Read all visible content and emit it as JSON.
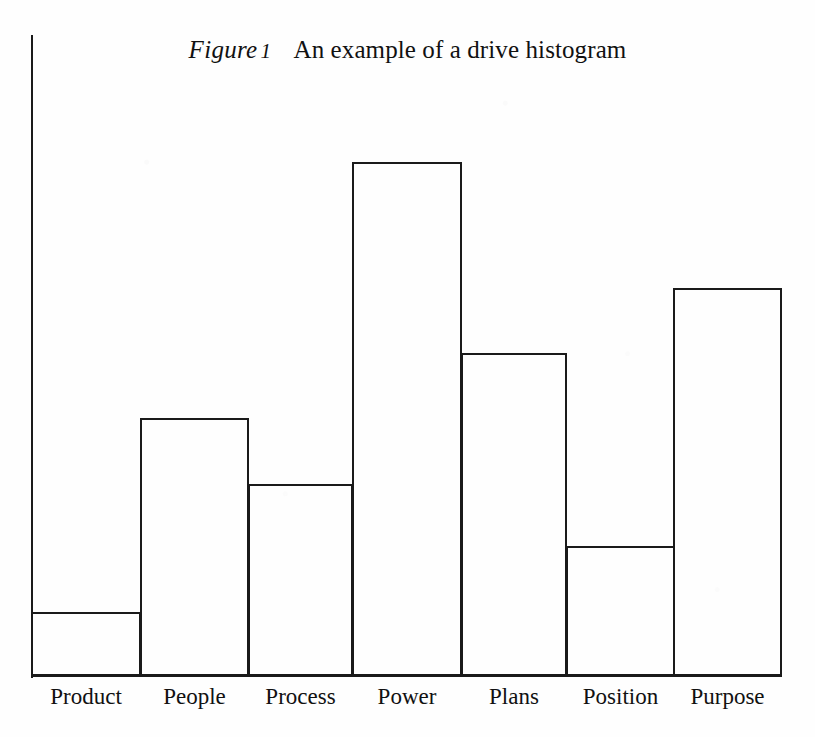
{
  "figure": {
    "label": "Figure",
    "number": "1",
    "caption": "An example of a drive histogram"
  },
  "colors": {
    "ink": "#1a1a1a",
    "page": "#fefefe",
    "bar_fill": "transparent"
  },
  "axes": {
    "y_axis_visible": true,
    "x_axis_visible": true,
    "y_tick_labels": [],
    "grid": false
  },
  "chart_data": {
    "type": "bar",
    "xlabel": "",
    "ylabel": "",
    "categories": [
      "Product",
      "People",
      "Process",
      "Power",
      "Plans",
      "Position",
      "Purpose"
    ],
    "values": [
      64,
      258,
      192,
      514,
      323,
      130,
      388
    ],
    "ylim": [
      0,
      641
    ],
    "grid": false,
    "legend": null,
    "bars": [
      {
        "label": "Product",
        "value": 64,
        "left": 31,
        "right": 141,
        "top": 612
      },
      {
        "label": "People",
        "value": 258,
        "left": 140,
        "right": 249,
        "top": 418
      },
      {
        "label": "Process",
        "value": 192,
        "left": 248,
        "right": 353,
        "top": 484
      },
      {
        "label": "Power",
        "value": 514,
        "left": 352,
        "right": 462,
        "top": 162
      },
      {
        "label": "Plans",
        "value": 323,
        "left": 461,
        "right": 567,
        "top": 353
      },
      {
        "label": "Position",
        "value": 130,
        "left": 566,
        "right": 675,
        "top": 546
      },
      {
        "label": "Purpose",
        "value": 388,
        "left": 673,
        "right": 782,
        "top": 288
      }
    ],
    "baseline_y": 676
  }
}
